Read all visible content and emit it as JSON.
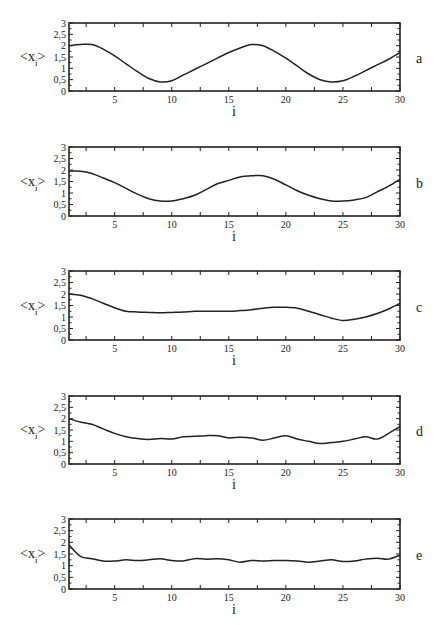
{
  "chart_data": [
    {
      "type": "line",
      "panel": "a",
      "ylabel": "<x_i>",
      "xlabel": "i",
      "xlim": [
        1,
        30
      ],
      "ylim": [
        0,
        3
      ],
      "xticks": [
        5,
        10,
        15,
        20,
        25,
        30
      ],
      "yticks": [
        "0",
        "0,5",
        "1",
        "1,5",
        "2",
        "2,5",
        "3"
      ],
      "grid": false,
      "x": [
        1,
        2,
        3,
        4,
        5,
        6,
        7,
        8,
        9,
        10,
        11,
        12,
        13,
        14,
        15,
        16,
        17,
        18,
        19,
        20,
        21,
        22,
        23,
        24,
        25,
        26,
        27,
        28,
        29,
        30
      ],
      "values": [
        2.0,
        2.05,
        2.05,
        1.85,
        1.55,
        1.2,
        0.85,
        0.55,
        0.4,
        0.45,
        0.7,
        0.95,
        1.2,
        1.45,
        1.7,
        1.9,
        2.05,
        2.0,
        1.75,
        1.45,
        1.1,
        0.75,
        0.5,
        0.4,
        0.45,
        0.65,
        0.9,
        1.15,
        1.4,
        1.7
      ]
    },
    {
      "type": "line",
      "panel": "b",
      "ylabel": "<x_i>",
      "xlabel": "i",
      "xlim": [
        1,
        30
      ],
      "ylim": [
        0,
        3
      ],
      "xticks": [
        5,
        10,
        15,
        20,
        25,
        30
      ],
      "yticks": [
        "0",
        "0,5",
        "1",
        "1,5",
        "2",
        "2,5",
        "3"
      ],
      "grid": false,
      "x": [
        1,
        2,
        3,
        4,
        5,
        6,
        7,
        8,
        9,
        10,
        11,
        12,
        13,
        14,
        15,
        16,
        17,
        18,
        19,
        20,
        21,
        22,
        23,
        24,
        25,
        26,
        27,
        28,
        29,
        30
      ],
      "values": [
        1.95,
        1.95,
        1.85,
        1.65,
        1.45,
        1.2,
        0.95,
        0.75,
        0.65,
        0.65,
        0.75,
        0.9,
        1.15,
        1.4,
        1.55,
        1.7,
        1.75,
        1.75,
        1.6,
        1.35,
        1.1,
        0.9,
        0.75,
        0.65,
        0.65,
        0.7,
        0.8,
        1.05,
        1.3,
        1.6
      ]
    },
    {
      "type": "line",
      "panel": "c",
      "ylabel": "<x_i>",
      "xlabel": "i",
      "xlim": [
        1,
        30
      ],
      "ylim": [
        0,
        3
      ],
      "xticks": [
        5,
        10,
        15,
        20,
        25,
        30
      ],
      "yticks": [
        "0",
        "0,5",
        "1",
        "1,5",
        "2",
        "2,5",
        "3"
      ],
      "grid": false,
      "x": [
        1,
        2,
        3,
        4,
        5,
        6,
        7,
        8,
        9,
        10,
        11,
        12,
        13,
        14,
        15,
        16,
        17,
        18,
        19,
        20,
        21,
        22,
        23,
        24,
        25,
        26,
        27,
        28,
        29,
        30
      ],
      "values": [
        2.0,
        1.95,
        1.8,
        1.6,
        1.4,
        1.25,
        1.22,
        1.2,
        1.18,
        1.2,
        1.22,
        1.25,
        1.25,
        1.25,
        1.25,
        1.28,
        1.32,
        1.38,
        1.42,
        1.42,
        1.38,
        1.25,
        1.1,
        0.95,
        0.85,
        0.9,
        1.0,
        1.15,
        1.35,
        1.6
      ]
    },
    {
      "type": "line",
      "panel": "d",
      "ylabel": "<x_i>",
      "xlabel": "i",
      "xlim": [
        1,
        30
      ],
      "ylim": [
        0,
        3
      ],
      "xticks": [
        5,
        10,
        15,
        20,
        25,
        30
      ],
      "yticks": [
        "0",
        "0,5",
        "1",
        "1,5",
        "2",
        "2,5",
        "3"
      ],
      "grid": false,
      "x": [
        1,
        2,
        3,
        4,
        5,
        6,
        7,
        8,
        9,
        10,
        11,
        12,
        13,
        14,
        15,
        16,
        17,
        18,
        19,
        20,
        21,
        22,
        23,
        24,
        25,
        26,
        27,
        28,
        29,
        30
      ],
      "values": [
        2.0,
        1.85,
        1.75,
        1.55,
        1.35,
        1.2,
        1.12,
        1.08,
        1.12,
        1.1,
        1.2,
        1.22,
        1.25,
        1.25,
        1.15,
        1.18,
        1.15,
        1.05,
        1.15,
        1.25,
        1.1,
        1.0,
        0.9,
        0.95,
        1.0,
        1.1,
        1.2,
        1.1,
        1.35,
        1.65
      ]
    },
    {
      "type": "line",
      "panel": "e",
      "ylabel": "<x_i>",
      "xlabel": "i",
      "xlim": [
        1,
        30
      ],
      "ylim": [
        0,
        3
      ],
      "xticks": [
        5,
        10,
        15,
        20,
        25,
        30
      ],
      "yticks": [
        "0",
        "0,5",
        "1",
        "1,5",
        "2",
        "2,5",
        "3"
      ],
      "grid": false,
      "x": [
        1,
        2,
        3,
        4,
        5,
        6,
        7,
        8,
        9,
        10,
        11,
        12,
        13,
        14,
        15,
        16,
        17,
        18,
        19,
        20,
        21,
        22,
        23,
        24,
        25,
        26,
        27,
        28,
        29,
        30
      ],
      "values": [
        1.9,
        1.4,
        1.3,
        1.2,
        1.2,
        1.25,
        1.22,
        1.25,
        1.3,
        1.22,
        1.2,
        1.3,
        1.28,
        1.3,
        1.25,
        1.15,
        1.22,
        1.2,
        1.22,
        1.22,
        1.2,
        1.15,
        1.2,
        1.25,
        1.18,
        1.2,
        1.28,
        1.32,
        1.28,
        1.45
      ]
    }
  ]
}
